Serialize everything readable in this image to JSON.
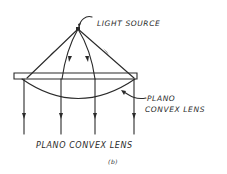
{
  "figure": {
    "labels": {
      "light_source": "LIGHT SOURCE",
      "lens_line1": "PLANO",
      "lens_line2": "CONVEX LENS",
      "title": "PLANO CONVEX LENS",
      "caption": "(b)"
    },
    "colors": {
      "ink": "#2a2a2a",
      "background": "#ffffff"
    }
  }
}
